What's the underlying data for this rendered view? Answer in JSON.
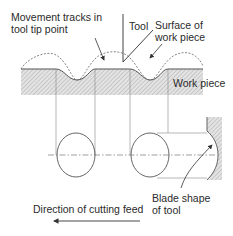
{
  "diagram": {
    "labels": {
      "movement_tracks_line1": "Movement tracks in",
      "movement_tracks_line2": "tool tip point",
      "tool": "Tool",
      "surface_line1": "Surface of",
      "surface_line2": "work piece",
      "work_piece": "Work piece",
      "blade_line1": "Blade shape",
      "blade_line2": "of tool",
      "feed_direction": "Direction of cutting feed"
    },
    "colors": {
      "line": "#555555",
      "hatch": "#bdbdbd",
      "text": "#2a2a2a"
    }
  }
}
